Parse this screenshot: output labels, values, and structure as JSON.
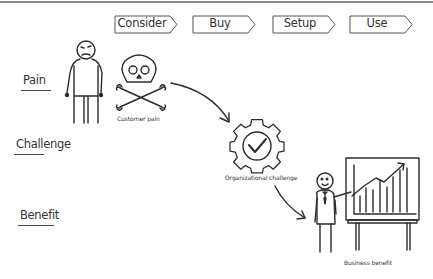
{
  "diagram": {
    "type": "customer-journey sketch",
    "stages": [
      {
        "label": "Consider"
      },
      {
        "label": "Buy"
      },
      {
        "label": "Setup"
      },
      {
        "label": "Use"
      }
    ],
    "rows": [
      {
        "label": "Pain"
      },
      {
        "label": "Challenge"
      },
      {
        "label": "Benefit"
      }
    ],
    "nodes": {
      "customer_pain": {
        "caption": "Customer pain",
        "icon": "skull-crossbones-icon"
      },
      "organizational_challenge": {
        "caption": "Organizational challenge",
        "icon": "gear-check-icon"
      },
      "business_benefit": {
        "caption": "Business benefit",
        "icon": "presenter-chart-icon"
      }
    },
    "flow": [
      "Customer pain",
      "Organizational challenge",
      "Business benefit"
    ],
    "colors": {
      "ink": "#2b2b2b",
      "background": "#ffffff",
      "border": "#8a8a8a"
    }
  }
}
